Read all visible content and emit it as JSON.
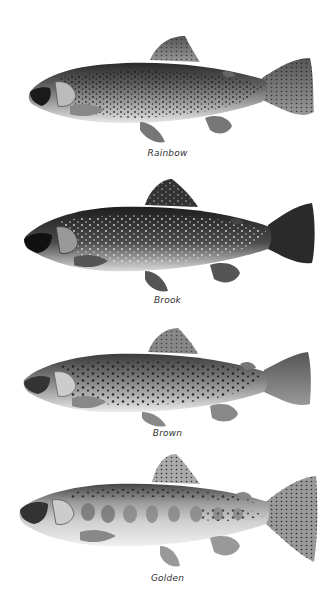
{
  "figure": {
    "fish": [
      {
        "id": "rainbow",
        "label": "Rainbow"
      },
      {
        "id": "brook",
        "label": "Brook"
      },
      {
        "id": "brown",
        "label": "Brown"
      },
      {
        "id": "golden",
        "label": "Golden"
      }
    ]
  }
}
